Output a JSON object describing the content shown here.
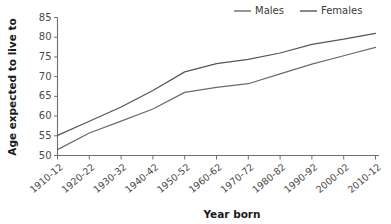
{
  "chart_data": {
    "type": "line",
    "title": "",
    "xlabel": "Year born",
    "ylabel": "Age expected to live to",
    "categories": [
      "1910-12",
      "1920-22",
      "1930-32",
      "1940-42",
      "1950-52",
      "1960-62",
      "1970-72",
      "1980-82",
      "1990-92",
      "2000-02",
      "2010-12"
    ],
    "series": [
      {
        "name": "Males",
        "color": "#6b6b6b",
        "values": [
          51.5,
          55.7,
          58.7,
          61.8,
          66.0,
          67.3,
          68.2,
          70.7,
          73.2,
          75.3,
          77.4
        ]
      },
      {
        "name": "Females",
        "color": "#565656",
        "values": [
          55.1,
          58.7,
          62.3,
          66.5,
          71.2,
          73.3,
          74.4,
          76.0,
          78.2,
          79.5,
          81.0
        ]
      }
    ],
    "ylim": [
      50,
      85
    ],
    "yticks": [
      50,
      55,
      60,
      65,
      70,
      75,
      80,
      85
    ],
    "ytick_labels": [
      "50",
      "55",
      "60",
      "65",
      "70",
      "75",
      "80",
      "85"
    ],
    "grid": false,
    "legend_position": "top-right"
  },
  "legend": {
    "entries": [
      {
        "label": "Males"
      },
      {
        "label": "Females"
      }
    ]
  },
  "axis": {
    "y_title": "Age expected to live to",
    "x_title": "Year born"
  }
}
